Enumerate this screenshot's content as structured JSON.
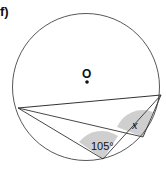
{
  "figure": {
    "label": "f)",
    "center_label": "O",
    "angles": [
      {
        "at": "C",
        "label": "105°"
      },
      {
        "at": "D",
        "label": "x"
      }
    ],
    "colors": {
      "stroke": "#333333",
      "shade": "#cfcfcf",
      "text": "#111111"
    }
  }
}
